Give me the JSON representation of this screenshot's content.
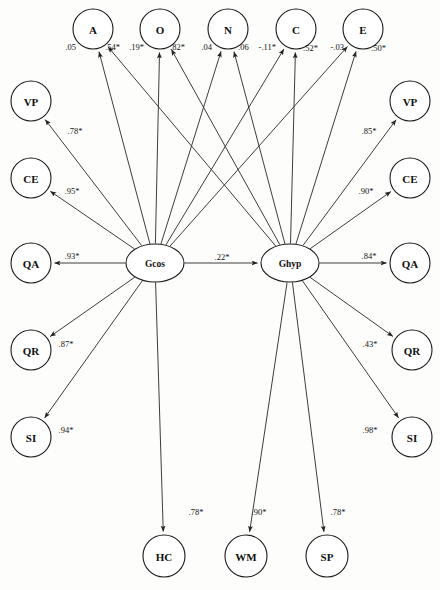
{
  "diagram": {
    "type": "structural-equation-path-diagram",
    "width": 440,
    "height": 590,
    "stroke_color": "#333333",
    "node_fill": "#ffffff",
    "background": "#fdfdfc"
  },
  "nodes": {
    "traits": [
      {
        "id": "A",
        "label": "A",
        "cx": 93,
        "cy": 29,
        "r": 20
      },
      {
        "id": "O",
        "label": "O",
        "cx": 160,
        "cy": 29,
        "r": 20
      },
      {
        "id": "N",
        "label": "N",
        "cx": 228,
        "cy": 29,
        "r": 20
      },
      {
        "id": "C",
        "label": "C",
        "cx": 296,
        "cy": 29,
        "r": 20
      },
      {
        "id": "E",
        "label": "E",
        "cx": 363,
        "cy": 29,
        "r": 20
      }
    ],
    "latent": [
      {
        "id": "Gcos",
        "label": "Gcos",
        "cx": 155,
        "cy": 263,
        "rx": 29,
        "ry": 19
      },
      {
        "id": "Ghyp",
        "label": "Ghyp",
        "cx": 290,
        "cy": 263,
        "rx": 29,
        "ry": 19
      }
    ],
    "left_indicators": [
      {
        "id": "L-VP",
        "label": "VP",
        "cx": 31,
        "cy": 101,
        "r": 20
      },
      {
        "id": "L-CE",
        "label": "CE",
        "cx": 31,
        "cy": 178,
        "r": 20
      },
      {
        "id": "L-QA",
        "label": "QA",
        "cx": 31,
        "cy": 263,
        "r": 20
      },
      {
        "id": "L-QR",
        "label": "QR",
        "cx": 31,
        "cy": 350,
        "r": 20
      },
      {
        "id": "L-SI",
        "label": "SI",
        "cx": 31,
        "cy": 437,
        "r": 20
      }
    ],
    "right_indicators": [
      {
        "id": "R-VP",
        "label": "VP",
        "cx": 410,
        "cy": 101,
        "r": 20
      },
      {
        "id": "R-CE",
        "label": "CE",
        "cx": 410,
        "cy": 178,
        "r": 20
      },
      {
        "id": "R-QA",
        "label": "QA",
        "cx": 410,
        "cy": 263,
        "r": 20
      },
      {
        "id": "R-QR",
        "label": "QR",
        "cx": 412,
        "cy": 350,
        "r": 20
      },
      {
        "id": "R-SI",
        "label": "SI",
        "cx": 412,
        "cy": 437,
        "r": 20
      }
    ],
    "bottom_indicators": [
      {
        "id": "HC",
        "label": "HC",
        "cx": 164,
        "cy": 556,
        "r": 21
      },
      {
        "id": "WM",
        "label": "WM",
        "cx": 246,
        "cy": 556,
        "r": 21
      },
      {
        "id": "SP",
        "label": "SP",
        "cx": 327,
        "cy": 556,
        "r": 21
      }
    ]
  },
  "edges": [
    {
      "id": "gcos-ghyp",
      "from": "Gcos",
      "to": "Ghyp",
      "coefficient": ".22*",
      "label_x": 222,
      "label_y": 257
    },
    {
      "id": "gcos-A",
      "from": "Gcos",
      "to": "A",
      "coefficient": ".05",
      "label_x": 76,
      "label_y": 47,
      "anchor": "end"
    },
    {
      "id": "ghyp-A",
      "from": "Ghyp",
      "to": "A",
      "coefficient": ".54*",
      "label_x": 105,
      "label_y": 47,
      "anchor": "start"
    },
    {
      "id": "gcos-O",
      "from": "Gcos",
      "to": "O",
      "coefficient": ".19*",
      "label_x": 144,
      "label_y": 47,
      "anchor": "end"
    },
    {
      "id": "ghyp-O",
      "from": "Ghyp",
      "to": "O",
      "coefficient": ".82*",
      "label_x": 170,
      "label_y": 47,
      "anchor": "start"
    },
    {
      "id": "gcos-N",
      "from": "Gcos",
      "to": "N",
      "coefficient": ".04",
      "label_x": 212,
      "label_y": 47,
      "anchor": "end"
    },
    {
      "id": "ghyp-N",
      "from": "Ghyp",
      "to": "N",
      "coefficient": ".06",
      "label_x": 238,
      "label_y": 47,
      "anchor": "start"
    },
    {
      "id": "gcos-C",
      "from": "Gcos",
      "to": "C",
      "coefficient": "-.11*",
      "label_x": 276,
      "label_y": 47,
      "anchor": "end"
    },
    {
      "id": "ghyp-C",
      "from": "Ghyp",
      "to": "C",
      "coefficient": ".52*",
      "label_x": 303,
      "label_y": 48,
      "anchor": "start"
    },
    {
      "id": "gcos-E",
      "from": "Gcos",
      "to": "E",
      "coefficient": "-.03",
      "label_x": 344,
      "label_y": 47,
      "anchor": "end"
    },
    {
      "id": "ghyp-E",
      "from": "Ghyp",
      "to": "E",
      "coefficient": ".50*",
      "label_x": 371,
      "label_y": 48,
      "anchor": "start"
    },
    {
      "id": "gcos-LVP",
      "from": "Gcos",
      "to": "L-VP",
      "coefficient": ".78*",
      "label_x": 75,
      "label_y": 131
    },
    {
      "id": "gcos-LCE",
      "from": "Gcos",
      "to": "L-CE",
      "coefficient": ".95*",
      "label_x": 72,
      "label_y": 191
    },
    {
      "id": "gcos-LQA",
      "from": "Gcos",
      "to": "L-QA",
      "coefficient": ".93*",
      "label_x": 72,
      "label_y": 256
    },
    {
      "id": "gcos-LQR",
      "from": "Gcos",
      "to": "L-QR",
      "coefficient": ".87*",
      "label_x": 66,
      "label_y": 344
    },
    {
      "id": "gcos-LSI",
      "from": "Gcos",
      "to": "L-SI",
      "coefficient": ".94*",
      "label_x": 66,
      "label_y": 430
    },
    {
      "id": "ghyp-RVP",
      "from": "Ghyp",
      "to": "R-VP",
      "coefficient": ".85*",
      "label_x": 369,
      "label_y": 131
    },
    {
      "id": "ghyp-RCE",
      "from": "Ghyp",
      "to": "R-CE",
      "coefficient": ".90*",
      "label_x": 366,
      "label_y": 191
    },
    {
      "id": "ghyp-RQA",
      "from": "Ghyp",
      "to": "R-QA",
      "coefficient": ".84*",
      "label_x": 369,
      "label_y": 256
    },
    {
      "id": "ghyp-RQR",
      "from": "Ghyp",
      "to": "R-QR",
      "coefficient": ".43*",
      "label_x": 370,
      "label_y": 344
    },
    {
      "id": "ghyp-RSI",
      "from": "Ghyp",
      "to": "R-SI",
      "coefficient": ".98*",
      "label_x": 370,
      "label_y": 430
    },
    {
      "id": "gcos-HC",
      "from": "Gcos",
      "to": "HC",
      "coefficient": ".78*",
      "label_x": 196,
      "label_y": 512
    },
    {
      "id": "ghyp-WM",
      "from": "Ghyp",
      "to": "WM",
      "coefficient": ".90*",
      "label_x": 259,
      "label_y": 512
    },
    {
      "id": "ghyp-SP",
      "from": "Ghyp",
      "to": "SP",
      "coefficient": ".78*",
      "label_x": 338,
      "label_y": 512
    }
  ]
}
